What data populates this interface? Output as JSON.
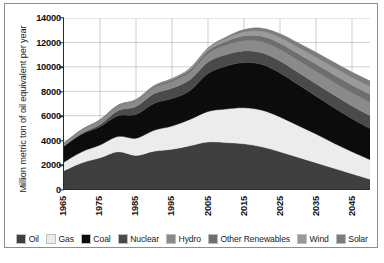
{
  "chart_data": {
    "type": "area",
    "title": "",
    "subtitle": "",
    "xlabel": "",
    "ylabel": "Million metric ton of oil equivalent per year",
    "stacked": true,
    "grid": true,
    "legend_position": "bottom",
    "xlim": [
      1965,
      2050
    ],
    "ylim": [
      0,
      14000
    ],
    "yticks": [
      0,
      2000,
      4000,
      6000,
      8000,
      10000,
      12000,
      14000
    ],
    "ytick_labels": [
      "0",
      "2000",
      "4000",
      "6000",
      "8000",
      "10000",
      "12000",
      "14000"
    ],
    "xticks": [
      1965,
      1975,
      1985,
      1995,
      2005,
      2015,
      2025,
      2035,
      2045
    ],
    "xtick_labels": [
      "1965",
      "1975",
      "1985",
      "1995",
      "2005",
      "2015",
      "2025",
      "2035",
      "2045"
    ],
    "x": [
      1965,
      1970,
      1975,
      1980,
      1985,
      1990,
      1995,
      2000,
      2005,
      2010,
      2015,
      2020,
      2025,
      2030,
      2035,
      2040,
      2045,
      2050
    ],
    "series": [
      {
        "name": "Oil",
        "color": "#3f3f3f",
        "values": [
          1500,
          2150,
          2550,
          3050,
          2750,
          3100,
          3250,
          3550,
          3850,
          3800,
          3700,
          3450,
          3050,
          2600,
          2150,
          1700,
          1250,
          800
        ]
      },
      {
        "name": "Gas",
        "color": "#ececec",
        "values": [
          700,
          900,
          1050,
          1250,
          1400,
          1700,
          1900,
          2150,
          2500,
          2750,
          2950,
          3000,
          2850,
          2600,
          2350,
          2050,
          1800,
          1600
        ]
      },
      {
        "name": "Coal",
        "color": "#0c0c0c",
        "values": [
          1300,
          1450,
          1500,
          1700,
          1950,
          2200,
          2250,
          2350,
          3100,
          3500,
          3700,
          3750,
          3600,
          3350,
          3100,
          2900,
          2700,
          2550
        ]
      },
      {
        "name": "Nuclear",
        "color": "#4a4a4a",
        "values": [
          20,
          60,
          180,
          400,
          650,
          800,
          850,
          900,
          950,
          950,
          950,
          950,
          980,
          1000,
          1020,
          1040,
          1050,
          1060
        ]
      },
      {
        "name": "Hydro",
        "color": "#8a8a8a",
        "values": [
          220,
          280,
          330,
          390,
          450,
          500,
          560,
          610,
          680,
          760,
          840,
          900,
          950,
          990,
          1020,
          1050,
          1070,
          1080
        ]
      },
      {
        "name": "Other Renewables",
        "color": "#6e6e6e",
        "values": [
          20,
          30,
          45,
          60,
          90,
          120,
          160,
          200,
          260,
          330,
          400,
          460,
          510,
          550,
          590,
          620,
          650,
          670
        ]
      },
      {
        "name": "Wind",
        "color": "#9a9a9a",
        "values": [
          0,
          0,
          2,
          5,
          12,
          25,
          50,
          90,
          150,
          230,
          320,
          400,
          460,
          510,
          550,
          580,
          600,
          620
        ]
      },
      {
        "name": "Solar",
        "color": "#7c7c7c",
        "values": [
          0,
          0,
          0,
          2,
          5,
          10,
          20,
          40,
          70,
          120,
          190,
          260,
          320,
          370,
          410,
          440,
          460,
          480
        ]
      }
    ],
    "totals": [
      3760,
      4870,
      5657,
      6857,
      7307,
      8455,
      9040,
      9890,
      11560,
      12440,
      13050,
      13170,
      12720,
      11970,
      11190,
      10380,
      9580,
      8860
    ],
    "peak": {
      "year": 2017,
      "value": 12200
    }
  },
  "legend": {
    "items": [
      {
        "label": "Oil",
        "color": "#3f3f3f"
      },
      {
        "label": "Gas",
        "color": "#ececec"
      },
      {
        "label": "Coal",
        "color": "#0c0c0c"
      },
      {
        "label": "Nuclear",
        "color": "#4a4a4a"
      },
      {
        "label": "Hydro",
        "color": "#8a8a8a"
      },
      {
        "label": "Other Renewables",
        "color": "#6e6e6e"
      },
      {
        "label": "Wind",
        "color": "#9a9a9a"
      },
      {
        "label": "Solar",
        "color": "#7c7c7c"
      }
    ]
  },
  "caption": {
    "text": ""
  }
}
